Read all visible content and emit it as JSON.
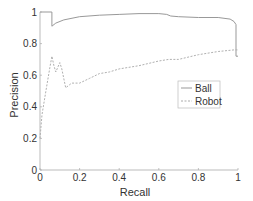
{
  "chart_data": {
    "type": "line",
    "title": "",
    "xlabel": "Recall",
    "ylabel": "Precision",
    "xlim": [
      0,
      1
    ],
    "ylim": [
      0,
      1
    ],
    "xticks": [
      "0",
      "0.2",
      "0.4",
      "0.6",
      "0.8",
      "1"
    ],
    "yticks": [
      "0",
      "0.2",
      "0.4",
      "0.6",
      "0.8",
      "1"
    ],
    "grid": false,
    "legend_position": "center-right",
    "series": [
      {
        "name": "Ball",
        "style": "solid",
        "x": [
          0,
          0.06,
          0.06,
          0.08,
          0.12,
          0.2,
          0.3,
          0.4,
          0.5,
          0.6,
          0.64,
          0.66,
          0.7,
          0.8,
          0.9,
          0.96,
          0.98,
          0.99,
          0.99,
          1.0
        ],
        "y": [
          1.0,
          1.0,
          0.91,
          0.93,
          0.95,
          0.97,
          0.98,
          0.985,
          0.99,
          0.99,
          0.985,
          0.975,
          0.97,
          0.965,
          0.965,
          0.955,
          0.94,
          0.92,
          0.72,
          0.72
        ]
      },
      {
        "name": "Robot",
        "style": "dashed",
        "x": [
          0,
          0.01,
          0.03,
          0.05,
          0.06,
          0.07,
          0.08,
          0.1,
          0.11,
          0.13,
          0.16,
          0.2,
          0.25,
          0.3,
          0.35,
          0.4,
          0.5,
          0.6,
          0.65,
          0.7,
          0.8,
          0.9,
          0.98,
          1.0
        ],
        "y": [
          0.2,
          0.35,
          0.5,
          0.65,
          0.72,
          0.66,
          0.62,
          0.68,
          0.64,
          0.52,
          0.55,
          0.55,
          0.58,
          0.61,
          0.62,
          0.64,
          0.66,
          0.69,
          0.7,
          0.7,
          0.73,
          0.75,
          0.76,
          0.76
        ]
      }
    ]
  }
}
